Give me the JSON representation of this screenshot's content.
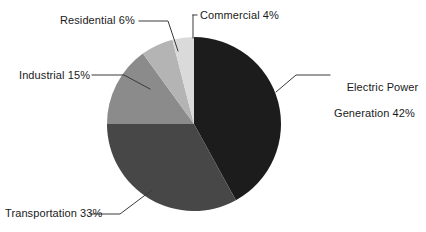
{
  "chart_data": {
    "type": "pie",
    "title": "",
    "categories": [
      "Electric Power Generation",
      "Transportation",
      "Industrial",
      "Residential",
      "Commercial"
    ],
    "values": [
      42,
      33,
      15,
      6,
      4
    ],
    "unit": "%",
    "legend": "callout-labels",
    "grid": false,
    "colors": [
      "#1c1c1c",
      "#474747",
      "#8b8b8b",
      "#b4b4b4",
      "#dadada"
    ],
    "start_angle_deg": 0,
    "direction": "electric-power-clockwise-from-top; others counterclockwise from top",
    "slices": [
      {
        "label": "Electric Power Generation",
        "value": 42,
        "display": "Electric Power Generation 42%",
        "color": "#1c1c1c"
      },
      {
        "label": "Transportation",
        "value": 33,
        "display": "Transportation 33%",
        "color": "#474747"
      },
      {
        "label": "Industrial",
        "value": 15,
        "display": "Industrial 15%",
        "color": "#8b8b8b"
      },
      {
        "label": "Residential",
        "value": 6,
        "display": "Residential 6%",
        "color": "#b4b4b4"
      },
      {
        "label": "Commercial",
        "value": 4,
        "display": "Commercial 4%",
        "color": "#dadada"
      }
    ]
  },
  "labels": {
    "commercial": "Commercial 4%",
    "residential": "Residential 6%",
    "industrial": "Industrial 15%",
    "transportation": "Transportation 33%",
    "electric_line1": "Electric Power",
    "electric_line2": "Generation 42%"
  },
  "style": {
    "background": "#ffffff",
    "text_color": "#1a1a1a",
    "leader_color": "#3a3a3a"
  }
}
